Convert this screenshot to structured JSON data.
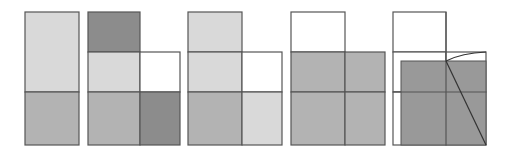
{
  "diagram": {
    "colors": {
      "stroke": "#555555",
      "white": "#ffffff",
      "light": "#d9d9d9",
      "medium": "#b3b3b3",
      "dark": "#8c8c8c",
      "fill5": "#999999"
    },
    "figures": [
      {
        "id": 1,
        "cells": [
          {
            "x": 25,
            "y": 12,
            "w": 54,
            "h": 80,
            "fill": "light"
          },
          {
            "x": 25,
            "y": 92,
            "w": 54,
            "h": 53,
            "fill": "medium"
          }
        ]
      },
      {
        "id": 2,
        "cells": [
          {
            "x": 88,
            "y": 12,
            "w": 52,
            "h": 40,
            "fill": "dark"
          },
          {
            "x": 88,
            "y": 52,
            "w": 52,
            "h": 40,
            "fill": "light"
          },
          {
            "x": 140,
            "y": 52,
            "w": 40,
            "h": 40,
            "fill": "white"
          },
          {
            "x": 88,
            "y": 92,
            "w": 52,
            "h": 53,
            "fill": "medium"
          },
          {
            "x": 140,
            "y": 92,
            "w": 40,
            "h": 53,
            "fill": "dark"
          }
        ]
      },
      {
        "id": 3,
        "cells": [
          {
            "x": 188,
            "y": 12,
            "w": 54,
            "h": 40,
            "fill": "light"
          },
          {
            "x": 188,
            "y": 52,
            "w": 54,
            "h": 40,
            "fill": "light"
          },
          {
            "x": 242,
            "y": 52,
            "w": 40,
            "h": 40,
            "fill": "white"
          },
          {
            "x": 188,
            "y": 92,
            "w": 54,
            "h": 53,
            "fill": "medium"
          },
          {
            "x": 242,
            "y": 92,
            "w": 40,
            "h": 53,
            "fill": "light"
          }
        ]
      },
      {
        "id": 4,
        "cells": [
          {
            "x": 291,
            "y": 12,
            "w": 54,
            "h": 40,
            "fill": "white"
          },
          {
            "x": 291,
            "y": 52,
            "w": 54,
            "h": 40,
            "fill": "medium"
          },
          {
            "x": 345,
            "y": 52,
            "w": 40,
            "h": 40,
            "fill": "medium"
          },
          {
            "x": 291,
            "y": 92,
            "w": 54,
            "h": 53,
            "fill": "medium"
          },
          {
            "x": 345,
            "y": 92,
            "w": 40,
            "h": 53,
            "fill": "medium"
          }
        ]
      },
      {
        "id": 5,
        "cells": [
          {
            "x": 393,
            "y": 12,
            "w": 53,
            "h": 40,
            "fill": "white"
          },
          {
            "x": 393,
            "y": 52,
            "w": 53,
            "h": 40,
            "fill": "white"
          },
          {
            "x": 446,
            "y": 52,
            "w": 40,
            "h": 40,
            "fill": "white"
          },
          {
            "x": 393,
            "y": 92,
            "w": 53,
            "h": 53,
            "fill": "white"
          },
          {
            "x": 446,
            "y": 92,
            "w": 40,
            "h": 53,
            "fill": "white"
          }
        ],
        "shaded_rect": {
          "x": 401,
          "y": 61,
          "w": 85,
          "h": 84,
          "fill": "fill5"
        },
        "grid_lines": [
          {
            "x1": 446,
            "y1": 12,
            "x2": 446,
            "y2": 145
          },
          {
            "x1": 393,
            "y1": 92,
            "x2": 486,
            "y2": 92
          }
        ],
        "diagonal": {
          "x1": 446,
          "y1": 61,
          "x2": 486,
          "y2": 145
        },
        "arc": {
          "d": "M446,61 Q462,53 486,52"
        }
      }
    ]
  }
}
